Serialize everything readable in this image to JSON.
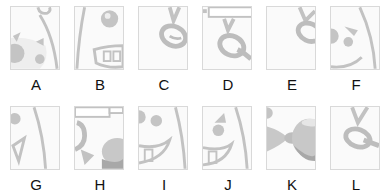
{
  "puzzle": {
    "options": [
      {
        "letter": "A",
        "content": "face-left-eye-cheek-fragment"
      },
      {
        "letter": "B",
        "content": "face-eye-teeth-fragment"
      },
      {
        "letter": "C",
        "content": "chain-link-fragment"
      },
      {
        "letter": "D",
        "content": "chain-link-with-bar-fragment"
      },
      {
        "letter": "E",
        "content": "chain-link-edge-fragment"
      },
      {
        "letter": "F",
        "content": "face-eye-brow-fragment"
      },
      {
        "letter": "G",
        "content": "face-eye-mouth-fragment"
      },
      {
        "letter": "H",
        "content": "chain-with-bar-and-ball-fragment"
      },
      {
        "letter": "I",
        "content": "face-eye-teeth-fragment"
      },
      {
        "letter": "J",
        "content": "face-brow-eye-teeth-fragment"
      },
      {
        "letter": "K",
        "content": "chain-ball-fragment"
      },
      {
        "letter": "L",
        "content": "chain-link-fragment"
      }
    ]
  },
  "colors": {
    "stroke": "#bdbdbd",
    "fill": "#c4c4c4",
    "dark": "#a8a8a8",
    "border": "#d9d9d9",
    "bg": "#fafafa"
  }
}
